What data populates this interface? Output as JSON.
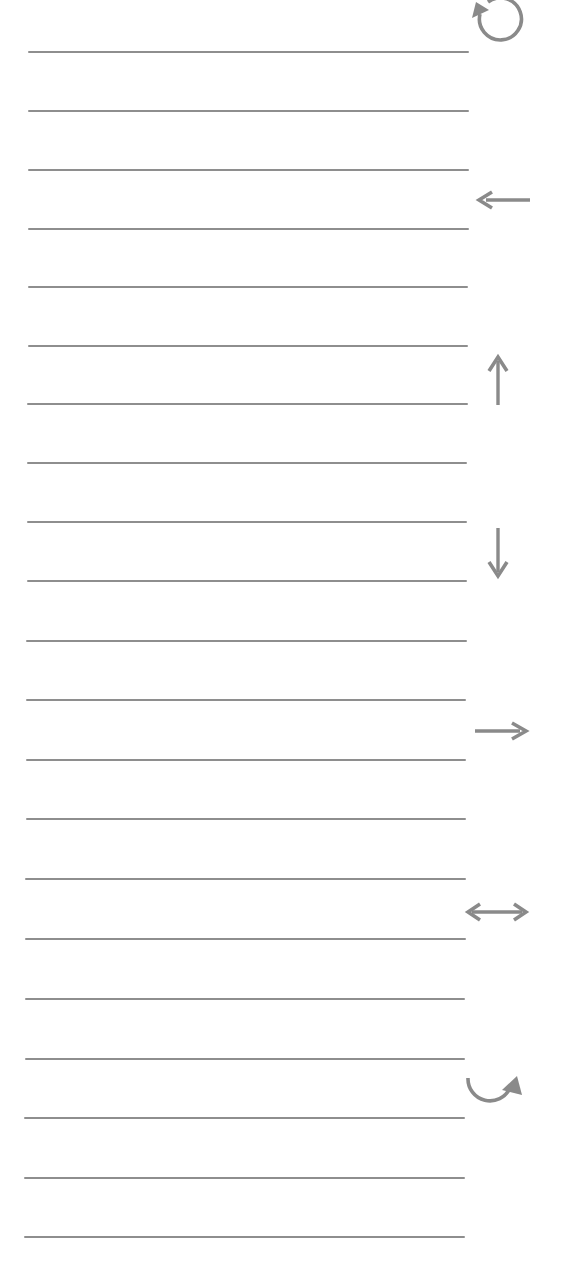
{
  "page": {
    "background": "#ffffff",
    "line_color": "#8e8e8e",
    "icon_color": "#8a8a8a"
  },
  "ruled_lines": {
    "count": 21,
    "positions": [
      {
        "y": 51,
        "x1": 28,
        "x2": 469
      },
      {
        "y": 110,
        "x1": 28,
        "x2": 469
      },
      {
        "y": 169,
        "x1": 28,
        "x2": 469
      },
      {
        "y": 228,
        "x1": 28,
        "x2": 469
      },
      {
        "y": 286,
        "x1": 28,
        "x2": 468
      },
      {
        "y": 345,
        "x1": 28,
        "x2": 468
      },
      {
        "y": 403,
        "x1": 27,
        "x2": 468
      },
      {
        "y": 462,
        "x1": 27,
        "x2": 467
      },
      {
        "y": 521,
        "x1": 27,
        "x2": 467
      },
      {
        "y": 580,
        "x1": 27,
        "x2": 467
      },
      {
        "y": 640,
        "x1": 26,
        "x2": 467
      },
      {
        "y": 699,
        "x1": 26,
        "x2": 466
      },
      {
        "y": 759,
        "x1": 26,
        "x2": 466
      },
      {
        "y": 818,
        "x1": 26,
        "x2": 466
      },
      {
        "y": 878,
        "x1": 25,
        "x2": 466
      },
      {
        "y": 938,
        "x1": 25,
        "x2": 466
      },
      {
        "y": 998,
        "x1": 25,
        "x2": 465
      },
      {
        "y": 1058,
        "x1": 25,
        "x2": 465
      },
      {
        "y": 1117,
        "x1": 24,
        "x2": 465
      },
      {
        "y": 1177,
        "x1": 24,
        "x2": 465
      },
      {
        "y": 1236,
        "x1": 24,
        "x2": 465
      }
    ]
  },
  "icons": [
    {
      "name": "rotate-counterclockwise-icon",
      "glyph": "↺"
    },
    {
      "name": "arrow-left-icon",
      "glyph": "←"
    },
    {
      "name": "arrow-up-icon",
      "glyph": "↑"
    },
    {
      "name": "arrow-down-icon",
      "glyph": "↓"
    },
    {
      "name": "arrow-right-icon",
      "glyph": "→"
    },
    {
      "name": "arrow-left-right-icon",
      "glyph": "↔"
    },
    {
      "name": "curved-arrow-up-right-icon",
      "glyph": "↷"
    }
  ]
}
